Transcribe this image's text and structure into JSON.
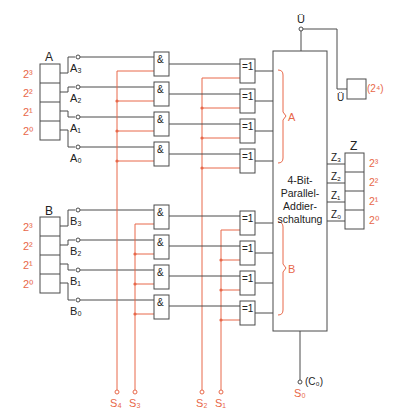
{
  "diagram": {
    "adder": {
      "label_lines": [
        "4-Bit-",
        "Parallel-",
        "Addier-",
        "schaltung"
      ],
      "overflow_top": "Ü",
      "overflow_out": "Ü",
      "overflow_weight": "(2⁴)",
      "carry_in": "(C₀)",
      "bracket_a": "A",
      "bracket_b": "B"
    },
    "register_a": {
      "label": "A",
      "weights": [
        "2³",
        "2²",
        "2¹",
        "2⁰"
      ],
      "outputs": [
        "A₃",
        "A₂",
        "A₁",
        "A₀"
      ]
    },
    "register_b": {
      "label": "B",
      "weights": [
        "2³",
        "2²",
        "2¹",
        "2⁰"
      ],
      "outputs": [
        "B₃",
        "B₂",
        "B₁",
        "B₀"
      ]
    },
    "register_z": {
      "label": "Z",
      "weights": [
        "2³",
        "2²",
        "2¹",
        "2⁰"
      ],
      "inputs": [
        "Z₃",
        "Z₂",
        "Z₁",
        "Z₀"
      ]
    },
    "gates": {
      "and_symbol": "&",
      "xor_symbol": "=1"
    },
    "control_signals": [
      "S₄",
      "S₃",
      "S₂",
      "S₁",
      "S₀"
    ],
    "colors": {
      "wire": "#4a4a4a",
      "control": "#e8684a"
    }
  }
}
